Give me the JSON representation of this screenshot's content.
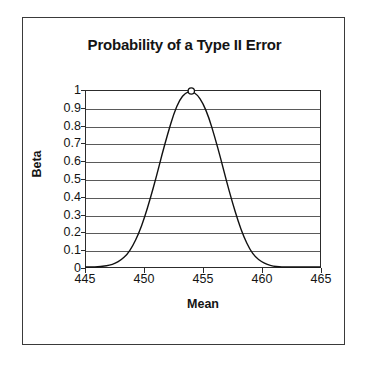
{
  "chart_data": {
    "type": "line",
    "title": "Probability of a Type II Error",
    "xlabel": "Mean",
    "ylabel": "Beta",
    "xlim": [
      445,
      465
    ],
    "ylim": [
      0,
      1
    ],
    "grid": true,
    "legend": false,
    "xticks": [
      "445",
      "450",
      "455",
      "460",
      "465"
    ],
    "xtick_values": [
      445,
      450,
      455,
      460,
      465
    ],
    "yticks": [
      "0",
      "0.1",
      "0.2",
      "0.3",
      "0.4",
      "0.5",
      "0.6",
      "0.7",
      "0.8",
      "0.9",
      "1"
    ],
    "ytick_values": [
      0,
      0.1,
      0.2,
      0.3,
      0.4,
      0.5,
      0.6,
      0.7,
      0.8,
      0.9,
      1
    ],
    "series": [
      {
        "name": "Beta",
        "marker_point": {
          "x": 454,
          "y": 1
        },
        "x": [
          445.0,
          445.5,
          446.0,
          446.5,
          447.0,
          447.5,
          448.0,
          448.5,
          449.0,
          449.5,
          450.0,
          450.5,
          451.0,
          451.5,
          452.0,
          452.5,
          453.0,
          453.5,
          454.0,
          454.5,
          455.0,
          455.5,
          456.0,
          456.5,
          457.0,
          457.5,
          458.0,
          458.5,
          459.0,
          459.5,
          460.0,
          460.5,
          461.0,
          461.5,
          462.0,
          462.5,
          463.0,
          463.5,
          464.0,
          464.5,
          465.0
        ],
        "y": [
          0.0,
          0.0,
          0.0,
          0.005,
          0.01,
          0.02,
          0.04,
          0.07,
          0.12,
          0.19,
          0.28,
          0.39,
          0.51,
          0.64,
          0.76,
          0.87,
          0.95,
          0.99,
          1.0,
          0.98,
          0.93,
          0.85,
          0.74,
          0.62,
          0.49,
          0.37,
          0.26,
          0.17,
          0.1,
          0.055,
          0.03,
          0.013,
          0.005,
          0.0,
          0.0,
          0.0,
          0.0,
          0.0,
          0.0,
          0.0,
          0.0
        ]
      }
    ]
  }
}
